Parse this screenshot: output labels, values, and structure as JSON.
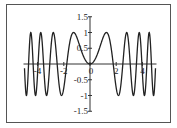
{
  "chart_data": {
    "type": "line",
    "title": "",
    "xlabel": "",
    "ylabel": "",
    "function": "sin(x^2)",
    "xlim": [
      -5,
      5
    ],
    "ylim": [
      -1.5,
      1.5
    ],
    "grid": false,
    "legend": null,
    "x_ticks": [
      -4,
      -2,
      0,
      2,
      4
    ],
    "x_tick_labels": [
      "-4",
      "-2",
      "0",
      "2",
      "4"
    ],
    "y_ticks": [
      1.5,
      1,
      0.5,
      -0.5,
      -1,
      -1.5
    ],
    "y_tick_labels": [
      "1.5",
      "1",
      "0.5",
      "-0.5",
      "-1",
      "-1.5"
    ],
    "series": [
      {
        "name": "sin(x^2)",
        "color": "#222222",
        "key_points": {
          "peaks_x": [
            -4.52,
            -3.76,
            -2.8,
            -1.25,
            1.25,
            2.8,
            3.76,
            4.52
          ],
          "peaks_y": 1,
          "troughs_x": [
            -4.85,
            -4.16,
            -3.32,
            -2.17,
            2.17,
            3.32,
            4.16,
            4.85
          ],
          "troughs_y": -1,
          "zeros_x": [
            -4.69,
            -4.34,
            -3.96,
            -3.54,
            -3.07,
            -2.51,
            -1.77,
            0,
            1.77,
            2.51,
            3.07,
            3.54,
            3.96,
            4.34,
            4.69
          ]
        }
      }
    ]
  }
}
